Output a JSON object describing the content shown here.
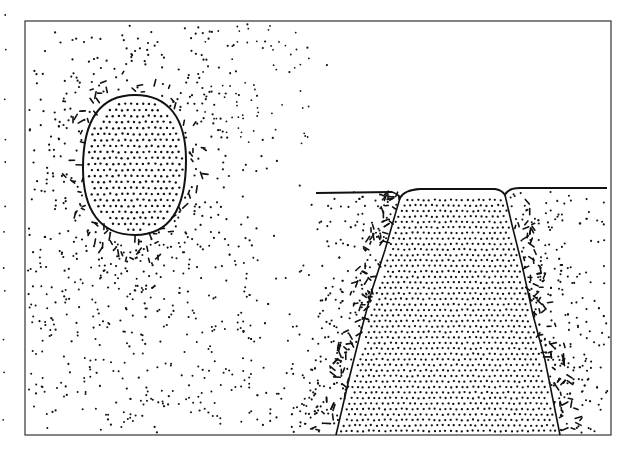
{
  "figure": {
    "colors": {
      "ink": "#111111",
      "paper": "#ffffff",
      "frame": "#333333"
    },
    "frame": {
      "x": 25,
      "y": 21,
      "width": 586,
      "height": 414
    },
    "oval": {
      "cx": 135,
      "cy": 165,
      "rx": 51,
      "ry": 70
    },
    "surface_line": {
      "y": 190,
      "x_start": 316,
      "x_end": 607
    },
    "trapezoid": {
      "top_left": [
        400,
        195
      ],
      "top_right": [
        505,
        190
      ],
      "bottom_right": [
        560,
        435
      ],
      "bottom_left": [
        336,
        435
      ]
    }
  }
}
